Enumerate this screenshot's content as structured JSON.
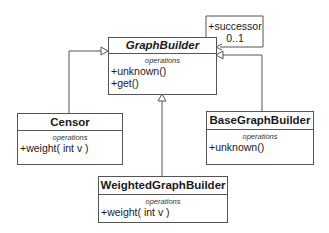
{
  "classes": {
    "graph_builder": {
      "name": "GraphBuilder",
      "abstract": true,
      "section": "operations",
      "operations": [
        "+unknown()",
        "+get()"
      ]
    },
    "censor": {
      "name": "Censor",
      "section": "operations",
      "operations": [
        "+weight( int v )"
      ]
    },
    "base_graph_builder": {
      "name": "BaseGraphBuilder",
      "section": "operations",
      "operations": [
        "+unknown()"
      ]
    },
    "weighted_graph_builder": {
      "name": "WeightedGraphBuilder",
      "section": "operations",
      "operations": [
        "+weight( int v )"
      ]
    }
  },
  "association": {
    "role": "+successor",
    "multiplicity": "0..1"
  },
  "colors": {
    "line": "#555555",
    "background": "#ffffff"
  }
}
